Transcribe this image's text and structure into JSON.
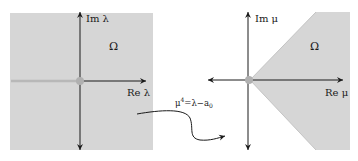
{
  "left_panel": {
    "y_axis_label": "Im λ",
    "x_axis_label": "Re λ",
    "region_label": "Ω",
    "region_color": "#d6d6d6",
    "branch_cut_color": "#b8b8b8",
    "origin_color": "#b0b0b0"
  },
  "right_panel": {
    "y_axis_label": "Im μ",
    "x_axis_label": "Re μ",
    "region_label": "Ω",
    "region_color": "#d6d6d6",
    "origin_color": "#b0b0b0"
  },
  "mapping": {
    "formula_base": "μ",
    "formula_exp": "4",
    "formula_rhs": "=λ−a",
    "formula_sub": "0"
  },
  "colors": {
    "axis": "#1a1a1a",
    "background": "#ffffff"
  }
}
